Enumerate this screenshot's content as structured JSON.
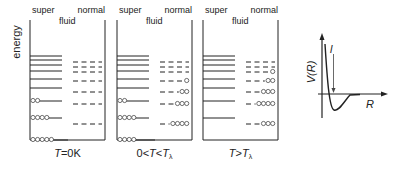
{
  "axis_label": "energy",
  "panels": [
    {
      "super_label": "super",
      "fluid_label": "fluid",
      "normal_label": "normal",
      "caption": {
        "T": "T",
        "rest": "=0K"
      },
      "superfluid_levels": [
        {
          "y": 56,
          "occ": 0
        },
        {
          "y": 60,
          "occ": 0
        },
        {
          "y": 65,
          "occ": 0
        },
        {
          "y": 71,
          "occ": 0
        },
        {
          "y": 79,
          "occ": 0
        },
        {
          "y": 88,
          "occ": 0
        },
        {
          "y": 101,
          "occ": 2
        },
        {
          "y": 118,
          "occ": 4
        },
        {
          "y": 140,
          "occ": 5
        }
      ],
      "normal_levels": [
        {
          "y": 62,
          "occ": 0
        },
        {
          "y": 67,
          "occ": 0
        },
        {
          "y": 72,
          "occ": 0
        },
        {
          "y": 81,
          "occ": 0
        },
        {
          "y": 92,
          "occ": 0
        },
        {
          "y": 104,
          "occ": 0
        },
        {
          "y": 124,
          "occ": 0
        }
      ]
    },
    {
      "super_label": "super",
      "fluid_label": "fluid",
      "normal_label": "normal",
      "caption": {
        "pre": "0<",
        "T": "T",
        "mid": "<",
        "Tl": "T",
        "sub": "λ"
      },
      "superfluid_levels": [
        {
          "y": 56,
          "occ": 0
        },
        {
          "y": 60,
          "occ": 0
        },
        {
          "y": 65,
          "occ": 0
        },
        {
          "y": 71,
          "occ": 0
        },
        {
          "y": 79,
          "occ": 0
        },
        {
          "y": 88,
          "occ": 0
        },
        {
          "y": 101,
          "occ": 2
        },
        {
          "y": 118,
          "occ": 4
        },
        {
          "y": 140,
          "occ": 4
        }
      ],
      "normal_levels": [
        {
          "y": 62,
          "occ": 0
        },
        {
          "y": 67,
          "occ": 0
        },
        {
          "y": 72,
          "occ": 0
        },
        {
          "y": 81,
          "occ": 1
        },
        {
          "y": 92,
          "occ": 2
        },
        {
          "y": 104,
          "occ": 3
        },
        {
          "y": 124,
          "occ": 4
        }
      ]
    },
    {
      "super_label": "super",
      "fluid_label": "fluid",
      "normal_label": "normal",
      "caption": {
        "T": "T",
        "mid": ">",
        "Tl": "T",
        "sub": "λ"
      },
      "superfluid_levels": [
        {
          "y": 56,
          "occ": 0
        },
        {
          "y": 60,
          "occ": 0
        },
        {
          "y": 65,
          "occ": 0
        },
        {
          "y": 71,
          "occ": 0
        },
        {
          "y": 79,
          "occ": 0
        },
        {
          "y": 88,
          "occ": 0
        },
        {
          "y": 101,
          "occ": 0
        },
        {
          "y": 118,
          "occ": 0
        },
        {
          "y": 140,
          "occ": 0
        }
      ],
      "normal_levels": [
        {
          "y": 62,
          "occ": 0
        },
        {
          "y": 67,
          "occ": 0
        },
        {
          "y": 72,
          "occ": 1
        },
        {
          "y": 81,
          "occ": 2
        },
        {
          "y": 92,
          "occ": 3
        },
        {
          "y": 104,
          "occ": 4
        },
        {
          "y": 124,
          "occ": 3
        }
      ]
    }
  ],
  "potential": {
    "ylabel": "V(R)",
    "xlabel": "R",
    "arrow_label": "l"
  }
}
